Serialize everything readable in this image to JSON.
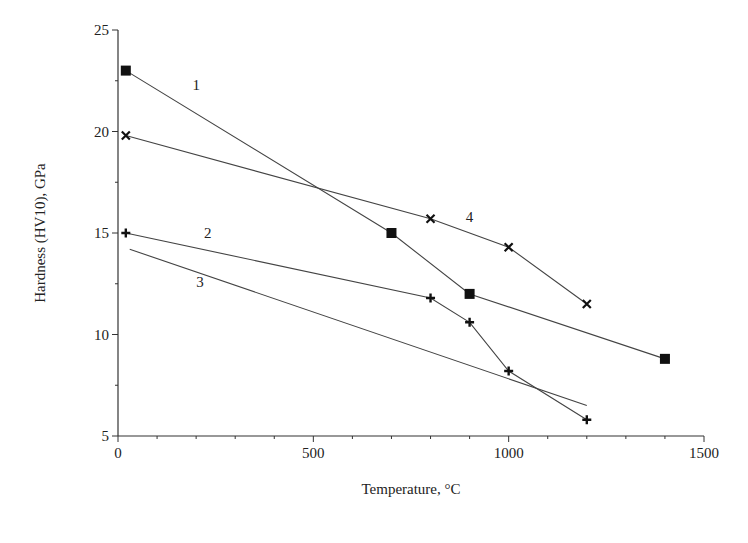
{
  "chart_data": {
    "type": "line",
    "title": "",
    "xlabel": "Temperature, °C",
    "ylabel": "Hardness (HV10), GPa",
    "xlim": [
      0,
      1500
    ],
    "ylim": [
      5,
      25
    ],
    "x_ticks": [
      0,
      500,
      1000,
      1500
    ],
    "y_ticks": [
      5,
      10,
      15,
      20,
      25
    ],
    "grid": false,
    "legend": "inline numeric labels",
    "series": [
      {
        "name": "1",
        "marker": "square",
        "x": [
          20,
          700,
          900,
          1400
        ],
        "values": [
          23.0,
          15.0,
          12.0,
          8.8
        ],
        "label_pos": [
          200,
          22.3
        ]
      },
      {
        "name": "2",
        "marker": "plus",
        "x": [
          20,
          800,
          900,
          1000,
          1200
        ],
        "values": [
          15.0,
          11.8,
          10.6,
          8.2,
          5.8
        ],
        "label_pos": [
          230,
          15.0
        ]
      },
      {
        "name": "3",
        "marker": "none",
        "x": [
          30,
          1200
        ],
        "values": [
          14.2,
          6.5
        ],
        "label_pos": [
          210,
          12.6
        ]
      },
      {
        "name": "4",
        "marker": "cross",
        "x": [
          20,
          800,
          1000,
          1200
        ],
        "values": [
          19.8,
          15.7,
          14.3,
          11.5
        ],
        "label_pos": [
          900,
          15.8
        ]
      }
    ]
  }
}
